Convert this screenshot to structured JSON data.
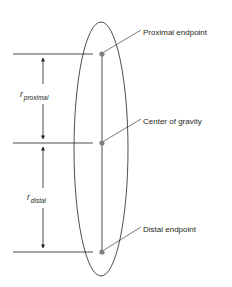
{
  "diagram": {
    "type": "segment-center-of-gravity",
    "colors": {
      "line": "#231f20",
      "point": "#808080",
      "background": "#ffffff"
    },
    "labels": {
      "proximal_endpoint": "Proximal endpoint",
      "center_of_gravity": "Center of gravity",
      "distal_endpoint": "Distal endpoint"
    },
    "dimensions": {
      "r_proximal": {
        "symbol": "r",
        "subscript": "proximal"
      },
      "r_distal": {
        "symbol": "r",
        "subscript": "distal"
      }
    },
    "points": [
      {
        "name": "proximal-endpoint",
        "x": 102,
        "y": 54
      },
      {
        "name": "center-of-gravity",
        "x": 102,
        "y": 143
      },
      {
        "name": "distal-endpoint",
        "x": 102,
        "y": 252
      }
    ]
  }
}
